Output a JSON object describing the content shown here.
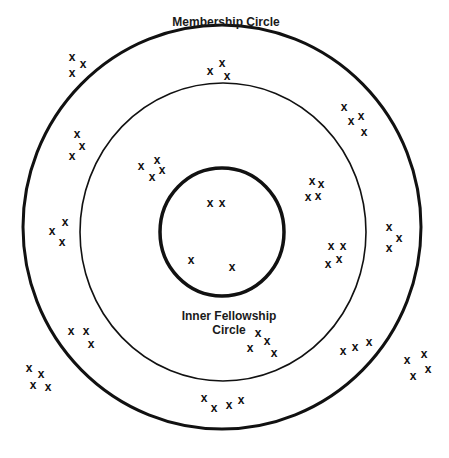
{
  "diagram": {
    "colors": {
      "stroke": "#111111",
      "background": "#ffffff",
      "text": "#1a1a1a"
    },
    "circles": [
      {
        "name": "membership-circle",
        "label": "Membership Circle",
        "cx": 222,
        "cy": 227,
        "rx": 199,
        "ry": 202,
        "stroke_width": 3
      },
      {
        "name": "middle-circle",
        "label": "",
        "cx": 223,
        "cy": 232,
        "rx": 143,
        "ry": 149,
        "stroke_width": 1.6
      },
      {
        "name": "inner-fellowship-circle",
        "label": "Inner Fellowship Circle",
        "cx": 222,
        "cy": 232,
        "rx": 62,
        "ry": 64,
        "stroke_width": 3.5
      }
    ],
    "labels": {
      "membership": "Membership Circle",
      "inner_line1": "Inner Fellowship",
      "inner_line2": "Circle"
    },
    "mark_glyph": "x",
    "marks": [
      {
        "group": "outside-top-left",
        "points": [
          [
            72,
            57
          ],
          [
            72,
            73
          ],
          [
            83,
            64
          ]
        ]
      },
      {
        "group": "outer-ring-top",
        "points": [
          [
            210,
            71
          ],
          [
            222,
            63
          ],
          [
            227,
            76
          ]
        ]
      },
      {
        "group": "outer-ring-upper-left",
        "points": [
          [
            77,
            134
          ],
          [
            82,
            146
          ],
          [
            72,
            156
          ]
        ]
      },
      {
        "group": "outer-ring-upper-right",
        "points": [
          [
            344,
            107
          ],
          [
            351,
            121
          ],
          [
            361,
            116
          ],
          [
            364,
            132
          ]
        ]
      },
      {
        "group": "middle-ring-upper-left",
        "points": [
          [
            141,
            166
          ],
          [
            157,
            160
          ],
          [
            152,
            177
          ],
          [
            162,
            170
          ]
        ]
      },
      {
        "group": "middle-ring-right",
        "points": [
          [
            312,
            181
          ],
          [
            321,
            184
          ],
          [
            308,
            197
          ],
          [
            318,
            196
          ]
        ]
      },
      {
        "group": "outer-ring-left",
        "points": [
          [
            52,
            231
          ],
          [
            65,
            222
          ],
          [
            62,
            242
          ]
        ]
      },
      {
        "group": "outer-ring-right",
        "points": [
          [
            389,
            227
          ],
          [
            399,
            238
          ],
          [
            389,
            248
          ]
        ]
      },
      {
        "group": "middle-ring-right-lower",
        "points": [
          [
            331,
            246
          ],
          [
            343,
            246
          ],
          [
            328,
            264
          ],
          [
            339,
            259
          ]
        ]
      },
      {
        "group": "inner-circle-top",
        "points": [
          [
            210,
            203
          ],
          [
            222,
            203
          ]
        ]
      },
      {
        "group": "inner-circle-bottom",
        "points": [
          [
            191,
            260
          ],
          [
            232,
            267
          ]
        ]
      },
      {
        "group": "middle-ring-lower-left",
        "points": [
          [
            71,
            331
          ],
          [
            86,
            331
          ],
          [
            91,
            344
          ]
        ]
      },
      {
        "group": "middle-ring-lower-center",
        "points": [
          [
            258,
            333
          ],
          [
            267,
            341
          ],
          [
            250,
            348
          ],
          [
            274,
            353
          ]
        ]
      },
      {
        "group": "middle-ring-lower-right",
        "points": [
          [
            343,
            351
          ],
          [
            355,
            347
          ],
          [
            369,
            342
          ]
        ]
      },
      {
        "group": "outside-bottom-left",
        "points": [
          [
            29,
            368
          ],
          [
            41,
            374
          ],
          [
            33,
            385
          ],
          [
            48,
            387
          ]
        ]
      },
      {
        "group": "outside-bottom-right",
        "points": [
          [
            407,
            360
          ],
          [
            424,
            354
          ],
          [
            413,
            376
          ],
          [
            428,
            369
          ]
        ]
      },
      {
        "group": "outer-ring-bottom",
        "points": [
          [
            204,
            398
          ],
          [
            214,
            408
          ],
          [
            229,
            405
          ],
          [
            241,
            400
          ]
        ]
      }
    ]
  }
}
